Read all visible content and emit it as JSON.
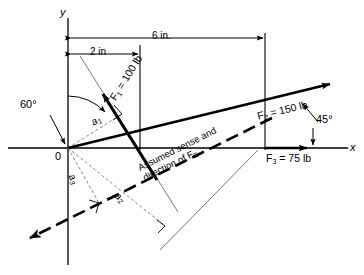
{
  "figure": {
    "type": "engineering-statics-force-diagram",
    "axes": {
      "x_label": "x",
      "y_label": "y",
      "origin_label": "0"
    },
    "dimensions": [
      {
        "name": "dim-2in",
        "label": "2 in"
      },
      {
        "name": "dim-6in",
        "label": "6 in."
      }
    ],
    "angles": [
      {
        "name": "angle-60",
        "label": "60°"
      },
      {
        "name": "angle-45",
        "label": "45°"
      }
    ],
    "forces": [
      {
        "name": "force-f1",
        "symbol": "F",
        "subscript": "1",
        "eq": " = 100 lb",
        "label": "F1 = 100 lb"
      },
      {
        "name": "force-f2",
        "symbol": "F",
        "subscript": "2",
        "eq": " = 150 lb",
        "label": "F2 = 150 lb"
      },
      {
        "name": "force-f3",
        "symbol": "F",
        "subscript": "3",
        "eq": " = 75 lb",
        "label": "F3 = 75 lb"
      }
    ],
    "moment_arms": [
      {
        "name": "moment-arm-a1",
        "symbol": "a",
        "subscript": "1"
      },
      {
        "name": "moment-arm-a2",
        "symbol": "a",
        "subscript": "2"
      },
      {
        "name": "moment-arm-a3",
        "symbol": "a",
        "subscript": "3"
      }
    ],
    "annotation": {
      "name": "assumed-sense-note",
      "line1": "Assumed sense and",
      "line2_prefix": "direction of ",
      "line2_symbol": "F",
      "line2_subscript": "E"
    },
    "colors": {
      "ink": "#000000",
      "paper": "#fdfdfd",
      "thin": "#555555"
    }
  }
}
